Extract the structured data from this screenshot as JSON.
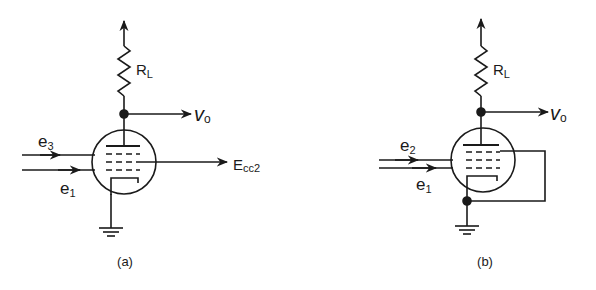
{
  "figure": {
    "panels": [
      {
        "id": "a",
        "caption": "(a)",
        "labels": {
          "load_resistor": "R",
          "load_resistor_sub": "L",
          "output": "v",
          "output_sub": "o",
          "input_top": "e",
          "input_top_sub": "3",
          "input_bottom": "e",
          "input_bottom_sub": "1",
          "screen_supply": "E",
          "screen_supply_sub": "cc2"
        }
      },
      {
        "id": "b",
        "caption": "(b)",
        "labels": {
          "load_resistor": "R",
          "load_resistor_sub": "L",
          "output": "v",
          "output_sub": "o",
          "input_top": "e",
          "input_top_sub": "2",
          "input_bottom": "e",
          "input_bottom_sub": "1"
        }
      }
    ],
    "colors": {
      "ink": "#1a1a1a",
      "background": "#ffffff"
    }
  }
}
